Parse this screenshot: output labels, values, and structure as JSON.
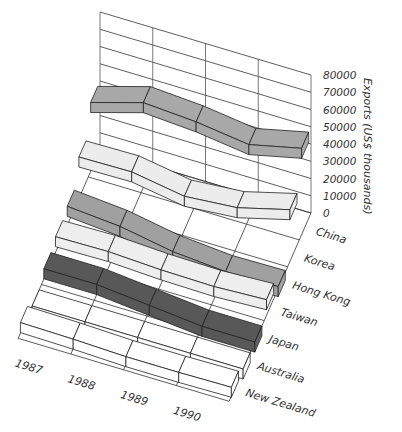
{
  "chart_data": {
    "type": "3d-ribbon",
    "title": "",
    "xlabel": "",
    "ylabel": "Exports (US$ thousands)",
    "categories": [
      "1987",
      "1988",
      "1989",
      "1990"
    ],
    "countries": [
      "China",
      "Korea",
      "Hong Kong",
      "Taiwan",
      "Japan",
      "Australia",
      "New Zealand"
    ],
    "ylim": [
      0,
      80000
    ],
    "yticks": [
      "0",
      "10000",
      "20000",
      "30000",
      "40000",
      "50000",
      "60000",
      "70000",
      "80000"
    ],
    "grid": true,
    "series": [
      {
        "name": "China",
        "color": "#a8a8a8",
        "values": [
          40000,
          58000,
          36000,
          50000
        ]
      },
      {
        "name": "Korea",
        "color": "#ececec",
        "values": [
          24000,
          25000,
          14000,
          30000
        ]
      },
      {
        "name": "Hong Kong",
        "color": "#a0a0a0",
        "values": [
          11000,
          6000,
          0,
          1000
        ]
      },
      {
        "name": "Taiwan",
        "color": "#eeeeee",
        "values": [
          9000,
          10000,
          6000,
          9000
        ]
      },
      {
        "name": "Japan",
        "color": "#585858",
        "values": [
          6000,
          6000,
          0,
          0
        ]
      },
      {
        "name": "Australia",
        "color": "#ffffff",
        "values": [
          0,
          0,
          0,
          0
        ]
      },
      {
        "name": "New Zealand",
        "color": "#ffffff",
        "values": [
          6000,
          5000,
          4000,
          5000
        ]
      }
    ]
  }
}
